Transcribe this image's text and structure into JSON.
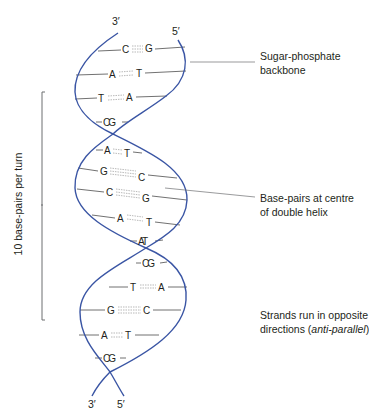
{
  "diagram": {
    "strand_color": "#3a55a4",
    "rung_color": "#4d4d4d",
    "highlight_color": "#2e8b3a",
    "top_ends": {
      "left": "3′",
      "right": "5′"
    },
    "bottom_ends": {
      "left": "3′",
      "right": "5′"
    },
    "base_pairs": [
      {
        "left": "C",
        "right": "G",
        "bonds": 3
      },
      {
        "left": "A",
        "right": "T",
        "bonds": 2
      },
      {
        "left": "T",
        "right": "A",
        "bonds": 2
      },
      {
        "left": "C",
        "right": "G",
        "bonds": 0,
        "compact": "CG"
      },
      {
        "left": "A",
        "right": "T",
        "bonds": 2
      },
      {
        "left": "G",
        "right": "C",
        "bonds": 3
      },
      {
        "left": "C",
        "right": "G",
        "bonds": 3
      },
      {
        "left": "A",
        "right": "T",
        "bonds": 2
      },
      {
        "left": "A",
        "right": "T",
        "bonds": 0,
        "compact": "AT",
        "highlight": true
      },
      {
        "left": "C",
        "right": "G",
        "bonds": 0,
        "compact": "CG"
      },
      {
        "left": "T",
        "right": "A",
        "bonds": 2
      },
      {
        "left": "G",
        "right": "C",
        "bonds": 3
      },
      {
        "left": "A",
        "right": "T",
        "bonds": 2
      },
      {
        "left": "C",
        "right": "G",
        "bonds": 0,
        "compact": "CG"
      }
    ],
    "annotations": {
      "backbone_line1": "Sugar-phosphate",
      "backbone_line2": "backbone",
      "basepairs_line1": "Base-pairs at centre",
      "basepairs_line2": "of double helix",
      "strands_line1": "Strands run in opposite",
      "strands_line2_prefix": "directions (",
      "strands_line2_italic": "anti-parallel",
      "strands_line2_suffix": ")"
    },
    "bracket_label": "10 base-pairs per turn"
  }
}
